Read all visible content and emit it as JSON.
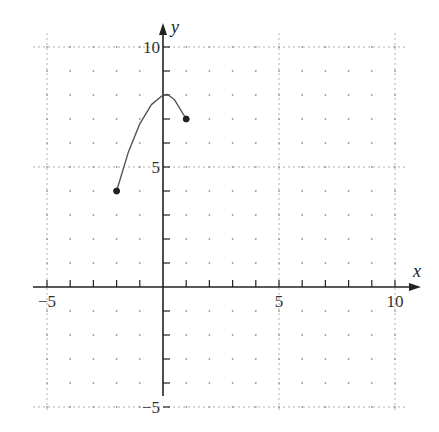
{
  "chart_data": {
    "type": "line",
    "title": "",
    "xlabel": "x",
    "ylabel": "y",
    "xlim": [
      -5,
      10
    ],
    "ylim": [
      -5,
      10
    ],
    "grid": true,
    "grid_style": "dotted at integers, dashed lines at multiples of 5",
    "x_ticks": [
      -5,
      5,
      10
    ],
    "y_ticks": [
      -5,
      5,
      10
    ],
    "x_tick_labels": [
      "−5",
      "5",
      "10"
    ],
    "y_tick_labels": [
      "−5",
      "5",
      "10"
    ],
    "series": [
      {
        "name": "f(x)",
        "description": "concave-down curve from closed point (-2,4) rising to maximum near (0,8) and falling to closed point (1,7)",
        "x": [
          -2,
          -1.5,
          -1,
          -0.5,
          0,
          0.2,
          0.5,
          1
        ],
        "y": [
          4,
          5.6,
          6.8,
          7.6,
          8,
          8.02,
          7.8,
          7
        ],
        "endpoints": [
          {
            "x": -2,
            "y": 4,
            "style": "closed"
          },
          {
            "x": 1,
            "y": 7,
            "style": "closed"
          }
        ]
      }
    ],
    "colors": {
      "curve": "#555555",
      "axis": "#222222",
      "grid": "#9a9a9a"
    }
  }
}
